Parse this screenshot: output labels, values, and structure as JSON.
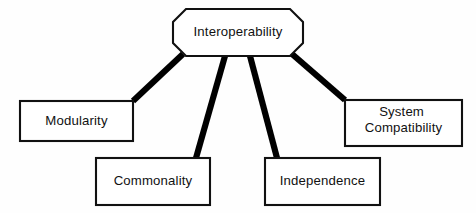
{
  "diagram": {
    "type": "hierarchy-tree",
    "background_color": "#fefefe",
    "line_color": "#000000",
    "box_fill": "#ffffff",
    "box_border_color": "#111111",
    "root": {
      "id": "interoperability",
      "label": "Interoperability",
      "shape": "octagon"
    },
    "children": [
      {
        "id": "modularity",
        "label": "Modularity",
        "shape": "rectangle",
        "lines": [
          "Modularity"
        ]
      },
      {
        "id": "commonality",
        "label": "Commonality",
        "shape": "rectangle",
        "lines": [
          "Commonality"
        ]
      },
      {
        "id": "independence",
        "label": "Independence",
        "shape": "rectangle",
        "lines": [
          "Independence"
        ]
      },
      {
        "id": "system-compatibility",
        "label": "System Compatibility",
        "shape": "rectangle",
        "lines": [
          "System",
          "Compatibility"
        ]
      }
    ],
    "edges": [
      {
        "from": "interoperability",
        "to": "modularity"
      },
      {
        "from": "interoperability",
        "to": "commonality"
      },
      {
        "from": "interoperability",
        "to": "independence"
      },
      {
        "from": "interoperability",
        "to": "system-compatibility"
      }
    ]
  }
}
